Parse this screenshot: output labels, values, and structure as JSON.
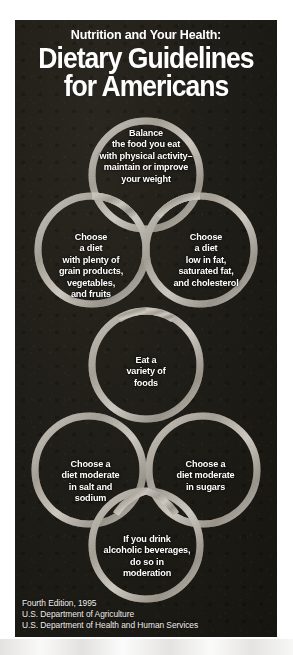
{
  "poster": {
    "kicker": "Nutrition and Your Health:",
    "title_line1": "Dietary Guidelines",
    "title_line2": "for Americans",
    "colors": {
      "panel_background": "#201e18",
      "text": "#ffffff",
      "ring_stroke": "#b9b5ad",
      "page_background": "#ffffff"
    }
  },
  "guidelines": [
    {
      "id": "balance",
      "position": "top-center",
      "lines": [
        "Balance",
        "the food you eat",
        "with physical activity–",
        "maintain or improve",
        "your weight"
      ]
    },
    {
      "id": "grain-products",
      "position": "row2-left",
      "lines": [
        "Choose",
        "a diet",
        "with plenty of",
        "grain products,",
        "vegetables,",
        "and fruits"
      ]
    },
    {
      "id": "low-fat",
      "position": "row2-right",
      "lines": [
        "Choose",
        "a diet",
        "low in fat,",
        "saturated fat,",
        "and cholesterol"
      ]
    },
    {
      "id": "variety",
      "position": "row3-center",
      "lines": [
        "Eat a",
        "variety of",
        "foods"
      ]
    },
    {
      "id": "salt-sodium",
      "position": "row4-left",
      "lines": [
        "Choose a",
        "diet moderate",
        "in salt and",
        "sodium"
      ]
    },
    {
      "id": "sugars",
      "position": "row4-right",
      "lines": [
        "Choose a",
        "diet moderate",
        "in sugars"
      ]
    },
    {
      "id": "alcohol",
      "position": "bottom-center",
      "lines": [
        "If you drink",
        "alcoholic beverages,",
        "do so in",
        "moderation"
      ]
    }
  ],
  "footer": {
    "edition": "Fourth Edition, 1995",
    "agency_1": "U.S. Department of Agriculture",
    "agency_2": "U.S. Department of Health and Human Services"
  }
}
